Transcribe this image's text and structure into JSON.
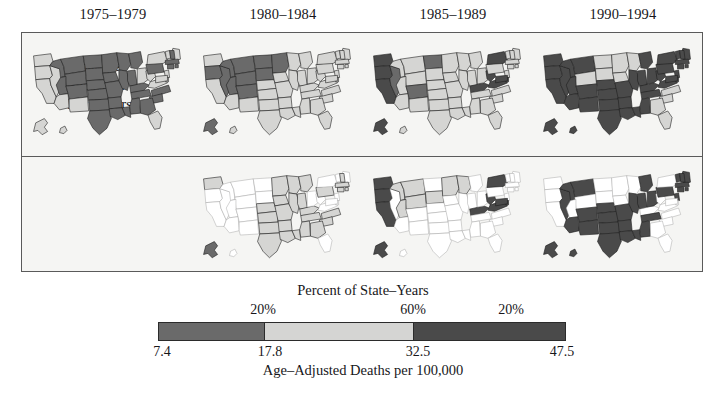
{
  "figure": {
    "title_visible": false,
    "background": "#ffffff",
    "panel_background": "#f5f5f3",
    "frame_color": "#5a5a5a"
  },
  "columns": [
    {
      "label": "1975–1979",
      "center_x": 113
    },
    {
      "label": "1980–1984",
      "center_x": 283
    },
    {
      "label": "1985–1989",
      "center_x": 453
    },
    {
      "label": "1990–1994",
      "center_x": 623
    }
  ],
  "row_labels": {
    "changes": [
      "Changes",
      "Shown in",
      "New Colors"
    ]
  },
  "legend": {
    "title": "Percent of State–Years",
    "axis_label": "Age–Adjusted Deaths per 100,000",
    "percents": [
      {
        "label": "20%",
        "center_x": 105
      },
      {
        "label": "60%",
        "center_x": 255
      },
      {
        "label": "20%",
        "center_x": 353
      }
    ],
    "ticks": [
      {
        "label": "7.4",
        "center_x": 12
      },
      {
        "label": "17.8",
        "center_x": 120
      },
      {
        "label": "32.5",
        "center_x": 268
      },
      {
        "label": "47.5",
        "center_x": 412
      }
    ],
    "segments": [
      {
        "name": "low",
        "color": "#6a6a6a",
        "from": 7.4,
        "to": 17.8,
        "percent": 20,
        "width_pct": 26
      },
      {
        "name": "mid",
        "color": "#d5d5d3",
        "from": 17.8,
        "to": 32.5,
        "percent": 60,
        "width_pct": 36.5
      },
      {
        "name": "high",
        "color": "#4a4a4a",
        "from": 32.5,
        "to": 47.5,
        "percent": 20,
        "width_pct": 37.5
      }
    ]
  },
  "chart_data": {
    "type": "map",
    "subtype": "choropleth-small-multiples",
    "title": "Age–Adjusted Deaths per 100,000",
    "legend_title": "Percent of State–Years",
    "rows": 2,
    "cols": 4,
    "class_colors": {
      "low": "#6a6a6a",
      "mid": "#d5d5d3",
      "high": "#4a4a4a",
      "none": "#ffffff"
    },
    "class_breaks": [
      7.4,
      17.8,
      32.5,
      47.5
    ],
    "panels": [
      {
        "row": 0,
        "col": 0,
        "period": "1975–1979",
        "states": {
          "WA": "mid",
          "OR": "mid",
          "CA": "mid",
          "NV": "mid",
          "ID": "low",
          "MT": "low",
          "WY": "low",
          "UT": "low",
          "AZ": "mid",
          "CO": "low",
          "NM": "mid",
          "ND": "low",
          "SD": "low",
          "NE": "low",
          "KS": "low",
          "OK": "low",
          "TX": "low",
          "MN": "low",
          "IA": "low",
          "MO": "low",
          "AR": "low",
          "LA": "low",
          "WI": "low",
          "IL": "low",
          "MS": "low",
          "MI": "low",
          "IN": "low",
          "KY": "low",
          "TN": "low",
          "AL": "low",
          "OH": "mid",
          "WV": "mid",
          "VA": "mid",
          "NC": "low",
          "SC": "low",
          "GA": "low",
          "FL": "mid",
          "PA": "low",
          "NY": "mid",
          "ME": "mid",
          "VT": "mid",
          "NH": "low",
          "MA": "low",
          "RI": "low",
          "CT": "low",
          "NJ": "mid",
          "DE": "mid",
          "MD": "mid",
          "AK": "mid",
          "HI": "mid"
        }
      },
      {
        "row": 0,
        "col": 1,
        "period": "1980–1984",
        "states": {
          "WA": "mid",
          "OR": "low",
          "CA": "mid",
          "NV": "low",
          "ID": "low",
          "MT": "low",
          "WY": "low",
          "UT": "low",
          "AZ": "mid",
          "CO": "low",
          "NM": "mid",
          "ND": "low",
          "SD": "low",
          "NE": "mid",
          "KS": "mid",
          "OK": "mid",
          "TX": "mid",
          "MN": "low",
          "IA": "mid",
          "MO": "mid",
          "AR": "mid",
          "LA": "mid",
          "WI": "mid",
          "IL": "mid",
          "MS": "mid",
          "MI": "mid",
          "IN": "mid",
          "KY": "mid",
          "TN": "mid",
          "AL": "mid",
          "OH": "mid",
          "WV": "mid",
          "VA": "mid",
          "NC": "mid",
          "SC": "mid",
          "GA": "mid",
          "FL": "mid",
          "PA": "mid",
          "NY": "mid",
          "ME": "mid",
          "VT": "mid",
          "NH": "mid",
          "MA": "mid",
          "RI": "mid",
          "CT": "mid",
          "NJ": "mid",
          "DE": "mid",
          "MD": "mid",
          "AK": "low",
          "HI": "mid"
        }
      },
      {
        "row": 0,
        "col": 2,
        "period": "1985–1989",
        "states": {
          "WA": "high",
          "OR": "high",
          "CA": "high",
          "NV": "low",
          "ID": "mid",
          "MT": "mid",
          "WY": "mid",
          "UT": "mid",
          "AZ": "mid",
          "CO": "low",
          "NM": "mid",
          "ND": "low",
          "SD": "mid",
          "NE": "mid",
          "KS": "mid",
          "OK": "mid",
          "TX": "mid",
          "MN": "mid",
          "IA": "mid",
          "MO": "mid",
          "AR": "mid",
          "LA": "mid",
          "WI": "mid",
          "IL": "mid",
          "MS": "mid",
          "MI": "mid",
          "IN": "mid",
          "KY": "high",
          "TN": "mid",
          "AL": "mid",
          "OH": "mid",
          "WV": "high",
          "VA": "high",
          "NC": "mid",
          "SC": "mid",
          "GA": "mid",
          "FL": "mid",
          "PA": "mid",
          "NY": "high",
          "ME": "mid",
          "VT": "mid",
          "NH": "mid",
          "MA": "mid",
          "RI": "mid",
          "CT": "mid",
          "NJ": "mid",
          "DE": "high",
          "MD": "high",
          "AK": "high",
          "HI": "mid"
        }
      },
      {
        "row": 0,
        "col": 3,
        "period": "1990–1994",
        "states": {
          "WA": "high",
          "OR": "high",
          "CA": "high",
          "NV": "high",
          "ID": "high",
          "MT": "high",
          "WY": "mid",
          "UT": "high",
          "AZ": "high",
          "CO": "high",
          "NM": "high",
          "ND": "mid",
          "SD": "mid",
          "NE": "high",
          "KS": "high",
          "OK": "high",
          "TX": "high",
          "MN": "mid",
          "IA": "mid",
          "MO": "high",
          "AR": "high",
          "LA": "high",
          "WI": "mid",
          "IL": "high",
          "MS": "high",
          "MI": "high",
          "IN": "high",
          "KY": "high",
          "TN": "high",
          "AL": "high",
          "OH": "high",
          "WV": "high",
          "VA": "high",
          "NC": "mid",
          "SC": "mid",
          "GA": "mid",
          "FL": "mid",
          "PA": "high",
          "NY": "high",
          "ME": "high",
          "VT": "high",
          "NH": "high",
          "MA": "high",
          "RI": "high",
          "CT": "high",
          "NJ": "high",
          "DE": "high",
          "MD": "high",
          "AK": "high",
          "HI": "high"
        }
      },
      {
        "row": 1,
        "col": 1,
        "period": "1980–1984 changes",
        "states": {
          "WA": "mid",
          "OR": "none",
          "CA": "none",
          "NV": "none",
          "ID": "none",
          "MT": "none",
          "WY": "none",
          "UT": "none",
          "AZ": "none",
          "CO": "none",
          "NM": "none",
          "ND": "none",
          "SD": "none",
          "NE": "mid",
          "KS": "mid",
          "OK": "mid",
          "TX": "mid",
          "MN": "mid",
          "IA": "mid",
          "MO": "mid",
          "AR": "mid",
          "LA": "mid",
          "WI": "mid",
          "IL": "mid",
          "MS": "mid",
          "MI": "mid",
          "IN": "mid",
          "KY": "mid",
          "TN": "mid",
          "AL": "mid",
          "OH": "none",
          "WV": "none",
          "VA": "none",
          "NC": "mid",
          "SC": "mid",
          "GA": "mid",
          "FL": "none",
          "PA": "mid",
          "NY": "none",
          "ME": "none",
          "VT": "none",
          "NH": "mid",
          "MA": "mid",
          "RI": "mid",
          "CT": "mid",
          "NJ": "none",
          "DE": "none",
          "MD": "none",
          "AK": "low",
          "HI": "none"
        }
      },
      {
        "row": 1,
        "col": 2,
        "period": "1985–1989 changes",
        "states": {
          "WA": "high",
          "OR": "high",
          "CA": "high",
          "NV": "none",
          "ID": "mid",
          "MT": "mid",
          "WY": "mid",
          "UT": "mid",
          "AZ": "none",
          "CO": "none",
          "NM": "none",
          "ND": "none",
          "SD": "mid",
          "NE": "none",
          "KS": "none",
          "OK": "none",
          "TX": "none",
          "MN": "mid",
          "IA": "none",
          "MO": "none",
          "AR": "none",
          "LA": "none",
          "WI": "mid",
          "IL": "none",
          "MS": "none",
          "MI": "none",
          "IN": "none",
          "KY": "high",
          "TN": "none",
          "AL": "none",
          "OH": "none",
          "WV": "high",
          "VA": "high",
          "NC": "none",
          "SC": "none",
          "GA": "none",
          "FL": "none",
          "PA": "none",
          "NY": "high",
          "ME": "none",
          "VT": "none",
          "NH": "none",
          "MA": "none",
          "RI": "none",
          "CT": "none",
          "NJ": "none",
          "DE": "high",
          "MD": "high",
          "AK": "high",
          "HI": "none"
        }
      },
      {
        "row": 1,
        "col": 3,
        "period": "1990–1994 changes",
        "states": {
          "WA": "none",
          "OR": "none",
          "CA": "none",
          "NV": "high",
          "ID": "high",
          "MT": "high",
          "WY": "none",
          "UT": "none",
          "AZ": "high",
          "CO": "high",
          "NM": "high",
          "ND": "none",
          "SD": "none",
          "NE": "high",
          "KS": "high",
          "OK": "high",
          "TX": "high",
          "MN": "none",
          "IA": "none",
          "MO": "high",
          "AR": "high",
          "LA": "high",
          "WI": "none",
          "IL": "high",
          "MS": "high",
          "MI": "high",
          "IN": "high",
          "KY": "none",
          "TN": "high",
          "AL": "high",
          "OH": "high",
          "WV": "none",
          "VA": "none",
          "NC": "none",
          "SC": "none",
          "GA": "none",
          "FL": "none",
          "PA": "high",
          "NY": "none",
          "ME": "high",
          "VT": "high",
          "NH": "high",
          "MA": "high",
          "RI": "high",
          "CT": "high",
          "NJ": "high",
          "DE": "none",
          "MD": "none",
          "AK": "high",
          "HI": "high"
        }
      }
    ]
  }
}
